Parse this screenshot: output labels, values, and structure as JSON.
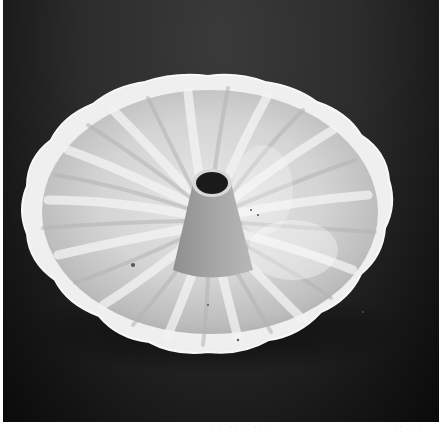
{
  "image": {
    "subject": "white ceramic fluted bundt cake pan on dark background",
    "photo_bounds": {
      "x": 3,
      "y": 0,
      "width": 436,
      "height": 422
    },
    "pan": {
      "cx": 207,
      "cy": 214,
      "rx": 185,
      "ry": 138
    },
    "tube_opening": {
      "cx": 209,
      "cy": 183,
      "rx": 17,
      "ry": 12
    },
    "colors": {
      "background_top": "#3a3a3a",
      "background_bottom": "#0a0a0a",
      "pan_light": "#f2f2f2",
      "pan_mid": "#c8c8c8",
      "pan_shadow": "#9a9a9a",
      "tube_hole": "#1a1a1a",
      "border": "#ffffff"
    }
  },
  "footer_strip": {
    "fragments": [
      "· ·  ·· ·  ·· ·",
      "·· ·  ·"
    ]
  }
}
